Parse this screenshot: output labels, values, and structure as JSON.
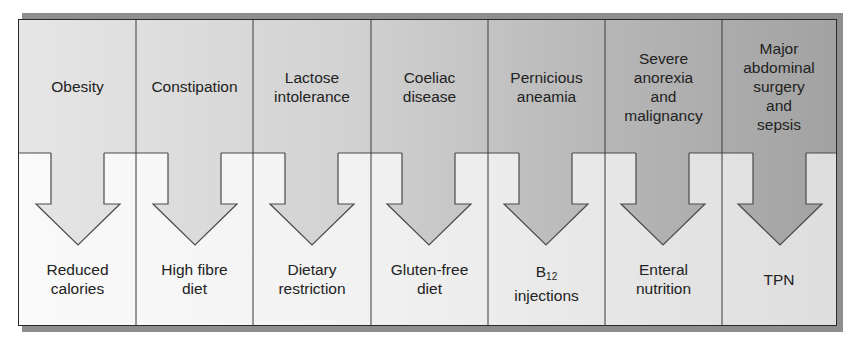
{
  "diagram": {
    "type": "condition-to-treatment flow",
    "columns": [
      {
        "condition": "Obesity",
        "treatment": "Reduced\ncalories"
      },
      {
        "condition": "Constipation",
        "treatment": "High fibre\ndiet"
      },
      {
        "condition": "Lactose\nintolerance",
        "treatment": "Dietary\nrestriction"
      },
      {
        "condition": "Coeliac\ndisease",
        "treatment": "Gluten-free\ndiet"
      },
      {
        "condition": "Pernicious\naneamia",
        "treatment_prefix": "B",
        "treatment_sub": "12",
        "treatment_suffix": "injections"
      },
      {
        "condition": "Severe\nanorexia\nand\nmalignancy",
        "treatment": "Enteral\nnutrition"
      },
      {
        "condition": "Major\nabdominal\nsurgery\nand\nsepsis",
        "treatment": "TPN"
      }
    ],
    "colors": {
      "top_light": "#e6e6e6",
      "top_dark": "#a2a2a2",
      "bottom_light": "#fafafa",
      "bottom_dark": "#dedede",
      "border": "#2a2a2a",
      "shadow": "#8e8e8e"
    }
  }
}
